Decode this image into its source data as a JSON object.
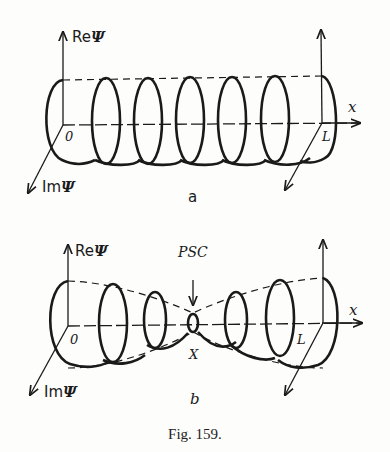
{
  "figure": {
    "caption": "Fig. 159.",
    "panels": [
      {
        "id": "a",
        "label": "a",
        "axes": {
          "vertical": "ReΨ",
          "vertical_prefix": "Re",
          "depth": "ImΨ",
          "depth_prefix": "Im",
          "psi": "Ψ",
          "horizontal": "x",
          "origin": "0",
          "end": "L"
        },
        "description": "Uniform helix of constant radius along x from 0 to L"
      },
      {
        "id": "b",
        "label": "b",
        "axes": {
          "vertical": "ReΨ",
          "vertical_prefix": "Re",
          "depth": "ImΨ",
          "depth_prefix": "Im",
          "psi": "Ψ",
          "horizontal": "x",
          "origin": "0",
          "end": "L"
        },
        "annotation": "PSC",
        "point": "X",
        "description": "Helix with radius shrinking to a node at X (phase-slip center) then growing again"
      }
    ]
  },
  "colors": {
    "ink": "#1a1a1a",
    "paper": "#fdfdfb"
  }
}
